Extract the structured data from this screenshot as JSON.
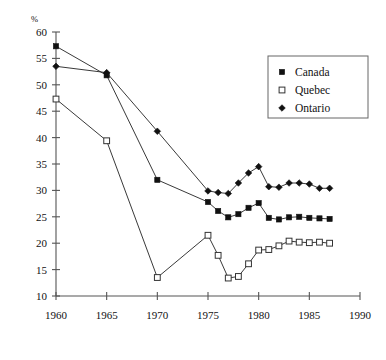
{
  "chart_data": {
    "type": "line",
    "title": "",
    "subtitle": "",
    "xlabel": "",
    "ylabel": "",
    "unit_label": "%",
    "xlim": [
      1960,
      1990
    ],
    "ylim": [
      10,
      60
    ],
    "xticks": [
      1960,
      1965,
      1970,
      1975,
      1980,
      1985,
      1990
    ],
    "yticks": [
      10,
      15,
      20,
      25,
      30,
      35,
      40,
      45,
      50,
      55,
      60
    ],
    "xtick_labels": [
      "1960",
      "1965",
      "1970",
      "1975",
      "1980",
      "1985",
      "1990"
    ],
    "ytick_labels": [
      "10",
      "15",
      "20",
      "25",
      "30",
      "35",
      "40",
      "45",
      "50",
      "55",
      "60"
    ],
    "grid": false,
    "legend_position": "top-right",
    "series": [
      {
        "name": "Canada",
        "marker": "filled-square",
        "color": "#111111",
        "x": [
          1960,
          1965,
          1970,
          1975,
          1976,
          1977,
          1978,
          1979,
          1980,
          1981,
          1982,
          1983,
          1984,
          1985,
          1986,
          1987
        ],
        "values": [
          57.3,
          51.8,
          32.0,
          27.8,
          26.1,
          24.9,
          25.5,
          26.7,
          27.6,
          24.8,
          24.5,
          24.9,
          25.0,
          24.8,
          24.7,
          24.6
        ]
      },
      {
        "name": "Quebec",
        "marker": "open-square",
        "color": "#333333",
        "x": [
          1960,
          1965,
          1970,
          1975,
          1976,
          1977,
          1978,
          1979,
          1980,
          1981,
          1982,
          1983,
          1984,
          1985,
          1986,
          1987
        ],
        "values": [
          47.3,
          39.4,
          13.5,
          21.5,
          17.7,
          13.4,
          13.7,
          16.1,
          18.7,
          18.8,
          19.5,
          20.4,
          20.2,
          20.1,
          20.2,
          20.0
        ]
      },
      {
        "name": "Ontario",
        "marker": "filled-diamond",
        "color": "#111111",
        "x": [
          1960,
          1965,
          1970,
          1975,
          1976,
          1977,
          1978,
          1979,
          1980,
          1981,
          1982,
          1983,
          1984,
          1985,
          1986,
          1987
        ],
        "values": [
          53.5,
          52.3,
          41.2,
          29.9,
          29.6,
          29.4,
          31.4,
          33.3,
          34.5,
          30.7,
          30.6,
          31.4,
          31.4,
          31.2,
          30.4,
          30.4
        ]
      }
    ],
    "legend": [
      {
        "label": "Canada",
        "marker": "filled-square"
      },
      {
        "label": "Quebec",
        "marker": "open-square"
      },
      {
        "label": "Ontario",
        "marker": "filled-diamond"
      }
    ]
  }
}
